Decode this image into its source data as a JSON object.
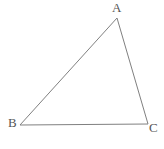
{
  "figure": {
    "type": "geometry-diagram",
    "shape": "triangle",
    "title": "",
    "canvas": {
      "width": 164,
      "height": 149,
      "background": "#ffffff"
    },
    "stroke": {
      "color": "#808080",
      "width": 1
    },
    "label_color": "#555555",
    "label_font_size": 13,
    "vertices": [
      {
        "id": "A",
        "label": "A",
        "x": 117,
        "y": 18,
        "label_x": 112,
        "label_y": 1
      },
      {
        "id": "B",
        "label": "B",
        "x": 20,
        "y": 125,
        "label_x": 8,
        "label_y": 116
      },
      {
        "id": "C",
        "label": "C",
        "x": 148,
        "y": 124,
        "label_x": 149,
        "label_y": 121
      }
    ],
    "edges": [
      {
        "id": "AB",
        "from": "A",
        "to": "B",
        "label": ""
      },
      {
        "id": "BC",
        "from": "B",
        "to": "C",
        "label": ""
      },
      {
        "id": "CA",
        "from": "C",
        "to": "A",
        "label": ""
      }
    ],
    "polygon_points": "117,18 20,125 148,124"
  }
}
